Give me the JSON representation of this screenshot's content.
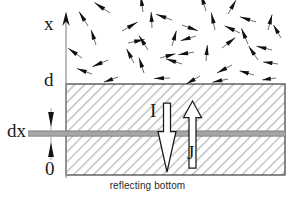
{
  "figure": {
    "caption": "reflecting bottom",
    "labels": {
      "axis_x": "x",
      "depth_top": "d",
      "depth_bottom": "0",
      "layer_thickness": "dx",
      "downward_flux": "I",
      "upward_flux": "J"
    },
    "icons": {
      "axis_arrow": "up-arrow-icon",
      "down_flux_arrow": "down-arrow-outline-icon",
      "up_flux_arrow": "up-arrow-outline-icon",
      "dx_marker": "double-arrow-marker-icon",
      "scatter_field": "random-arrow-field-icon"
    },
    "colors": {
      "stroke": "#1a1a1a",
      "axis": "#8a8a8a",
      "hatch": "#b8b8b8",
      "slab_fill": "#ffffff",
      "band": "#a9a9a9",
      "background": "#ffffff"
    },
    "geometry": {
      "slab_left": 66,
      "slab_right": 285,
      "slab_top": 84,
      "slab_bottom": 175,
      "axis_x": 66,
      "axis_top": 16,
      "band_y": 131,
      "band_height": 5
    },
    "scatter_arrows": [
      {
        "x": 110,
        "y": 13,
        "angle": 214,
        "len": 19
      },
      {
        "x": 143,
        "y": 12,
        "angle": 262,
        "len": 16
      },
      {
        "x": 172,
        "y": 20,
        "angle": 200,
        "len": 17
      },
      {
        "x": 206,
        "y": 11,
        "angle": 253,
        "len": 18
      },
      {
        "x": 228,
        "y": 14,
        "angle": 300,
        "len": 16
      },
      {
        "x": 256,
        "y": 22,
        "angle": 198,
        "len": 17
      },
      {
        "x": 88,
        "y": 26,
        "angle": 238,
        "len": 17
      },
      {
        "x": 122,
        "y": 31,
        "angle": 330,
        "len": 18
      },
      {
        "x": 152,
        "y": 28,
        "angle": 267,
        "len": 16
      },
      {
        "x": 182,
        "y": 25,
        "angle": 20,
        "len": 17
      },
      {
        "x": 196,
        "y": 36,
        "angle": 163,
        "len": 16
      },
      {
        "x": 215,
        "y": 30,
        "angle": 258,
        "len": 18
      },
      {
        "x": 240,
        "y": 33,
        "angle": 205,
        "len": 17
      },
      {
        "x": 268,
        "y": 30,
        "angle": 285,
        "len": 16
      },
      {
        "x": 281,
        "y": 38,
        "angle": 240,
        "len": 15
      },
      {
        "x": 96,
        "y": 45,
        "angle": 252,
        "len": 16
      },
      {
        "x": 128,
        "y": 43,
        "angle": 348,
        "len": 17
      },
      {
        "x": 148,
        "y": 50,
        "angle": 238,
        "len": 17
      },
      {
        "x": 172,
        "y": 46,
        "angle": 286,
        "len": 16
      },
      {
        "x": 194,
        "y": 52,
        "angle": 170,
        "len": 16
      },
      {
        "x": 222,
        "y": 48,
        "angle": 322,
        "len": 17
      },
      {
        "x": 248,
        "y": 44,
        "angle": 247,
        "len": 17
      },
      {
        "x": 272,
        "y": 50,
        "angle": 194,
        "len": 16
      },
      {
        "x": 82,
        "y": 58,
        "angle": 215,
        "len": 17
      },
      {
        "x": 108,
        "y": 60,
        "angle": 157,
        "len": 17
      },
      {
        "x": 134,
        "y": 63,
        "angle": 242,
        "len": 16
      },
      {
        "x": 160,
        "y": 58,
        "angle": 345,
        "len": 16
      },
      {
        "x": 182,
        "y": 64,
        "angle": 198,
        "len": 17
      },
      {
        "x": 206,
        "y": 61,
        "angle": 275,
        "len": 16
      },
      {
        "x": 232,
        "y": 65,
        "angle": 152,
        "len": 17
      },
      {
        "x": 258,
        "y": 60,
        "angle": 236,
        "len": 17
      },
      {
        "x": 278,
        "y": 64,
        "angle": 188,
        "len": 15
      },
      {
        "x": 92,
        "y": 74,
        "angle": 200,
        "len": 16
      },
      {
        "x": 118,
        "y": 77,
        "angle": 160,
        "len": 15
      },
      {
        "x": 144,
        "y": 73,
        "angle": 252,
        "len": 16
      },
      {
        "x": 170,
        "y": 78,
        "angle": 178,
        "len": 16
      },
      {
        "x": 200,
        "y": 76,
        "angle": 150,
        "len": 16
      },
      {
        "x": 228,
        "y": 79,
        "angle": 168,
        "len": 16
      },
      {
        "x": 254,
        "y": 75,
        "angle": 196,
        "len": 15
      },
      {
        "x": 276,
        "y": 78,
        "angle": 172,
        "len": 14
      }
    ]
  }
}
